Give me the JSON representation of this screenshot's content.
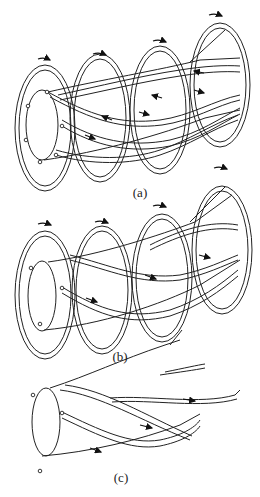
{
  "figure": {
    "panels": [
      {
        "id": "a",
        "label": "(a)",
        "label_pos": {
          "x": 140,
          "y": 184
        },
        "description": "Twisted filament bundle passing through four concentric coil rings with opposing helical flow arrows"
      },
      {
        "id": "b",
        "label": "(b)",
        "label_pos": {
          "x": 128,
          "y": 348
        },
        "description": "Twisted filament bundle through four coil rings with unidirectional flow arrows"
      },
      {
        "id": "c",
        "label": "(c)",
        "label_pos": {
          "x": 121,
          "y": 469
        },
        "description": "Twisted filament bundle without coil rings, unidirectional flow arrows"
      }
    ],
    "colors": {
      "line": "#222222",
      "background": "#ffffff"
    }
  }
}
